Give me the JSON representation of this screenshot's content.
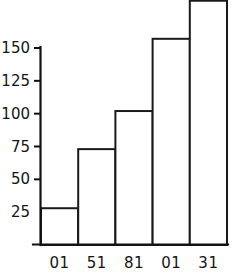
{
  "chart_data": {
    "type": "bar",
    "title": "",
    "subtitle": "",
    "xlabel": "",
    "ylabel": "",
    "categories": [
      "01",
      "51",
      "81",
      "01",
      "31"
    ],
    "values": [
      28,
      73,
      102,
      157,
      186
    ],
    "series": [
      {
        "name": "",
        "values": [
          28,
          73,
          102,
          157,
          186
        ]
      }
    ],
    "ylim": [
      0,
      190
    ],
    "xlim": [
      0,
      5
    ],
    "y_ticks": [
      25,
      50,
      75,
      100,
      125,
      150
    ],
    "y_tick_labels": [
      "25",
      "50",
      "75",
      "100",
      "125",
      "150"
    ],
    "x_tick_labels": [
      "01",
      "51",
      "81",
      "01",
      "31"
    ],
    "grid": false,
    "legend": false,
    "legend_position": "none",
    "bar_fill_color": "#ffffff",
    "bar_edge_color": "#1a1a1a",
    "axis_color": "#111111",
    "background_color": "#ffffff"
  },
  "figure": {
    "width": 236,
    "height": 275
  }
}
